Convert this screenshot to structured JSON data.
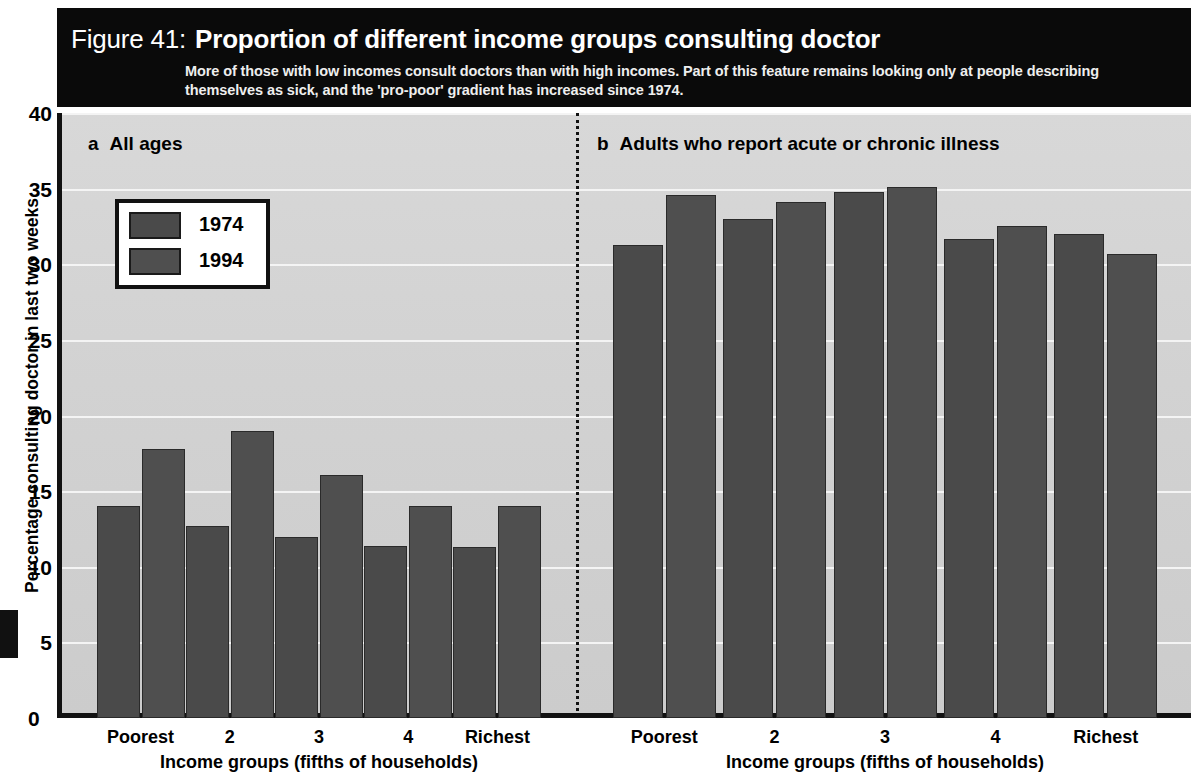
{
  "figure": {
    "number_label": "Figure 41:",
    "title": "Proportion of different income groups consulting doctor",
    "subtitle": "More of those with low incomes consult doctors than with high incomes. Part of this feature remains looking only at people describing themselves as sick, and the 'pro-poor' gradient has increased since 1974."
  },
  "legend": {
    "items": [
      {
        "label": "1974",
        "color": "#4a4a4a"
      },
      {
        "label": "1994",
        "color": "#4f4f4f"
      }
    ]
  },
  "axes": {
    "y_title": "Percentage consulting doctor in last two weeks",
    "y_ticks": [
      "40",
      "35",
      "30",
      "25",
      "20",
      "15",
      "10",
      "5",
      "0"
    ],
    "x_title": "Income groups (fifths of households)",
    "x_categories": [
      "Poorest",
      "2",
      "3",
      "4",
      "Richest"
    ]
  },
  "panels": [
    {
      "letter": "a",
      "title": "All ages"
    },
    {
      "letter": "b",
      "title": "Adults who report acute or chronic illness"
    }
  ],
  "chart_data": {
    "type": "bar",
    "title": "Proportion of different income groups consulting doctor",
    "subtitle": "More of those with low incomes consult doctors than with high incomes. Part of this feature remains looking only at people describing themselves as sick, and the 'pro-poor' gradient has increased since 1974.",
    "xlabel": "Income groups (fifths of households)",
    "ylabel": "Percentage consulting doctor in last two weeks",
    "ylim": [
      0,
      40
    ],
    "yticks": [
      0,
      5,
      10,
      15,
      20,
      25,
      30,
      35,
      40
    ],
    "grid": true,
    "legend": [
      "1974",
      "1994"
    ],
    "legend_position": "upper-left-panel-a",
    "categories": [
      "Poorest",
      "2",
      "3",
      "4",
      "Richest"
    ],
    "panels": [
      {
        "letter": "a",
        "title": "All ages",
        "series": [
          {
            "name": "1974",
            "values": [
              14.0,
              12.7,
              12.0,
              11.4,
              11.3
            ]
          },
          {
            "name": "1994",
            "values": [
              17.8,
              19.0,
              16.1,
              14.0,
              14.0
            ]
          }
        ]
      },
      {
        "letter": "b",
        "title": "Adults who report acute or chronic illness",
        "series": [
          {
            "name": "1974",
            "values": [
              31.3,
              33.0,
              34.8,
              31.7,
              32.0
            ]
          },
          {
            "name": "1994",
            "values": [
              34.6,
              34.1,
              35.1,
              32.5,
              30.7
            ]
          }
        ]
      }
    ]
  }
}
